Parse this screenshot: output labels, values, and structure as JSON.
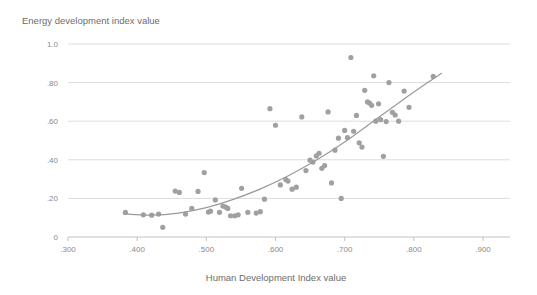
{
  "chart_data": {
    "type": "scatter",
    "title": "",
    "ylabel": "Energy development index value",
    "xlabel": "Human Development Index value",
    "xlim": [
      0.265,
      0.925
    ],
    "ylim": [
      0.0,
      1.06
    ],
    "xticks": [
      0.3,
      0.4,
      0.5,
      0.6,
      0.7,
      0.8,
      0.9
    ],
    "xtick_labels": [
      ".300",
      ".400",
      ".500",
      ".600",
      ".700",
      ".800",
      ".900"
    ],
    "yticks": [
      0.0,
      0.2,
      0.4,
      0.6,
      0.8,
      1.0
    ],
    "ytick_labels": [
      "0",
      ".20",
      ".40",
      ".60",
      ".80",
      "1.0"
    ],
    "grid": "horizontal",
    "legend": null,
    "point_color": "#a0a0a0",
    "line_color": "#9a9a9a",
    "grid_color": "#dcdcdc",
    "axis_color": "#c2c2c2",
    "text_color": "#6d6d6d",
    "marker_radius": 2.6,
    "points": [
      {
        "x": 0.383,
        "y": 0.128
      },
      {
        "x": 0.409,
        "y": 0.115
      },
      {
        "x": 0.421,
        "y": 0.113
      },
      {
        "x": 0.431,
        "y": 0.119
      },
      {
        "x": 0.437,
        "y": 0.05
      },
      {
        "x": 0.455,
        "y": 0.238
      },
      {
        "x": 0.461,
        "y": 0.231
      },
      {
        "x": 0.47,
        "y": 0.119
      },
      {
        "x": 0.479,
        "y": 0.148
      },
      {
        "x": 0.488,
        "y": 0.236
      },
      {
        "x": 0.497,
        "y": 0.334
      },
      {
        "x": 0.503,
        "y": 0.129
      },
      {
        "x": 0.506,
        "y": 0.134
      },
      {
        "x": 0.513,
        "y": 0.192
      },
      {
        "x": 0.519,
        "y": 0.128
      },
      {
        "x": 0.524,
        "y": 0.16
      },
      {
        "x": 0.528,
        "y": 0.155
      },
      {
        "x": 0.531,
        "y": 0.148
      },
      {
        "x": 0.535,
        "y": 0.11
      },
      {
        "x": 0.541,
        "y": 0.11
      },
      {
        "x": 0.546,
        "y": 0.115
      },
      {
        "x": 0.551,
        "y": 0.252
      },
      {
        "x": 0.56,
        "y": 0.128
      },
      {
        "x": 0.572,
        "y": 0.124
      },
      {
        "x": 0.578,
        "y": 0.131
      },
      {
        "x": 0.584,
        "y": 0.196
      },
      {
        "x": 0.592,
        "y": 0.665
      },
      {
        "x": 0.6,
        "y": 0.579
      },
      {
        "x": 0.607,
        "y": 0.27
      },
      {
        "x": 0.615,
        "y": 0.298
      },
      {
        "x": 0.618,
        "y": 0.29
      },
      {
        "x": 0.624,
        "y": 0.248
      },
      {
        "x": 0.63,
        "y": 0.258
      },
      {
        "x": 0.638,
        "y": 0.622
      },
      {
        "x": 0.644,
        "y": 0.344
      },
      {
        "x": 0.65,
        "y": 0.398
      },
      {
        "x": 0.654,
        "y": 0.388
      },
      {
        "x": 0.659,
        "y": 0.42
      },
      {
        "x": 0.663,
        "y": 0.434
      },
      {
        "x": 0.667,
        "y": 0.356
      },
      {
        "x": 0.671,
        "y": 0.37
      },
      {
        "x": 0.676,
        "y": 0.648
      },
      {
        "x": 0.681,
        "y": 0.28
      },
      {
        "x": 0.686,
        "y": 0.45
      },
      {
        "x": 0.691,
        "y": 0.512
      },
      {
        "x": 0.695,
        "y": 0.2
      },
      {
        "x": 0.7,
        "y": 0.552
      },
      {
        "x": 0.704,
        "y": 0.515
      },
      {
        "x": 0.709,
        "y": 0.93
      },
      {
        "x": 0.713,
        "y": 0.548
      },
      {
        "x": 0.717,
        "y": 0.63
      },
      {
        "x": 0.721,
        "y": 0.488
      },
      {
        "x": 0.725,
        "y": 0.466
      },
      {
        "x": 0.729,
        "y": 0.76
      },
      {
        "x": 0.733,
        "y": 0.7
      },
      {
        "x": 0.736,
        "y": 0.694
      },
      {
        "x": 0.739,
        "y": 0.682
      },
      {
        "x": 0.742,
        "y": 0.835
      },
      {
        "x": 0.745,
        "y": 0.6
      },
      {
        "x": 0.749,
        "y": 0.69
      },
      {
        "x": 0.752,
        "y": 0.608
      },
      {
        "x": 0.756,
        "y": 0.418
      },
      {
        "x": 0.76,
        "y": 0.598
      },
      {
        "x": 0.764,
        "y": 0.8
      },
      {
        "x": 0.769,
        "y": 0.646
      },
      {
        "x": 0.773,
        "y": 0.632
      },
      {
        "x": 0.778,
        "y": 0.6
      },
      {
        "x": 0.786,
        "y": 0.756
      },
      {
        "x": 0.793,
        "y": 0.672
      },
      {
        "x": 0.828,
        "y": 0.832
      }
    ],
    "trend_line": [
      {
        "x": 0.38,
        "y": 0.12
      },
      {
        "x": 0.42,
        "y": 0.113
      },
      {
        "x": 0.46,
        "y": 0.124
      },
      {
        "x": 0.5,
        "y": 0.152
      },
      {
        "x": 0.54,
        "y": 0.196
      },
      {
        "x": 0.58,
        "y": 0.252
      },
      {
        "x": 0.62,
        "y": 0.32
      },
      {
        "x": 0.66,
        "y": 0.4
      },
      {
        "x": 0.7,
        "y": 0.492
      },
      {
        "x": 0.74,
        "y": 0.596
      },
      {
        "x": 0.78,
        "y": 0.7
      },
      {
        "x": 0.82,
        "y": 0.8
      },
      {
        "x": 0.84,
        "y": 0.848
      }
    ]
  }
}
